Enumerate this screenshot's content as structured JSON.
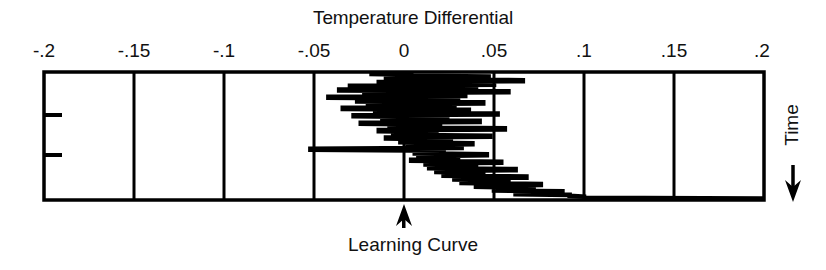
{
  "chart_data": {
    "type": "line",
    "title": "Temperature Differential",
    "xlabel": "Temperature Differential",
    "ylabel": "Time",
    "y_direction": "downward",
    "grid": true,
    "legend": null,
    "xlim": [
      -0.2,
      0.2
    ],
    "x_ticks": [
      -0.2,
      -0.15,
      -0.1,
      -0.05,
      0,
      0.05,
      0.1,
      0.15,
      0.2
    ],
    "x_tick_labels": [
      "-.2",
      "-.15",
      "-.1",
      "-.05",
      "0",
      ".05",
      ".1",
      ".15",
      ".2"
    ],
    "y_ticks": [
      0.32,
      0.65
    ],
    "y_tick_labels": [
      "",
      ""
    ],
    "annotations": [
      {
        "text": "Learning Curve",
        "x": 0,
        "position": "below-axis",
        "marker": "up-arrow"
      },
      {
        "text": "Time",
        "position": "right",
        "marker": "down-arrow",
        "orientation": "vertical"
      }
    ],
    "series": [
      {
        "name": "Temperature differential trace",
        "note": "Oscillating control trace; time runs from bottom (start) to top (end); amplitude narrows and mean drifts from 0 toward about 0.1",
        "points": [
          [
            0.0,
            1.0
          ],
          [
            -0.018,
            0.992
          ],
          [
            -0.018,
            0.984
          ],
          [
            0.004,
            0.978
          ],
          [
            0.004,
            0.97
          ],
          [
            0.047,
            0.964
          ],
          [
            0.047,
            0.956
          ],
          [
            -0.01,
            0.95
          ],
          [
            -0.01,
            0.942
          ],
          [
            0.066,
            0.936
          ],
          [
            0.066,
            0.928
          ],
          [
            -0.014,
            0.922
          ],
          [
            -0.014,
            0.914
          ],
          [
            0.05,
            0.908
          ],
          [
            0.05,
            0.9
          ],
          [
            -0.03,
            0.893
          ],
          [
            -0.03,
            0.885
          ],
          [
            0.04,
            0.879
          ],
          [
            0.04,
            0.871
          ],
          [
            -0.036,
            0.864
          ],
          [
            -0.036,
            0.856
          ],
          [
            0.058,
            0.85
          ],
          [
            0.058,
            0.842
          ],
          [
            -0.022,
            0.836
          ],
          [
            -0.022,
            0.828
          ],
          [
            0.034,
            0.821
          ],
          [
            0.034,
            0.813
          ],
          [
            -0.042,
            0.807
          ],
          [
            -0.042,
            0.799
          ],
          [
            0.03,
            0.792
          ],
          [
            0.03,
            0.784
          ],
          [
            -0.026,
            0.778
          ],
          [
            -0.026,
            0.77
          ],
          [
            0.044,
            0.763
          ],
          [
            0.044,
            0.755
          ],
          [
            -0.02,
            0.749
          ],
          [
            -0.02,
            0.741
          ],
          [
            0.028,
            0.734
          ],
          [
            0.028,
            0.726
          ],
          [
            -0.034,
            0.72
          ],
          [
            -0.034,
            0.712
          ],
          [
            0.036,
            0.705
          ],
          [
            0.036,
            0.697
          ],
          [
            -0.016,
            0.691
          ],
          [
            -0.016,
            0.683
          ],
          [
            0.052,
            0.676
          ],
          [
            0.052,
            0.668
          ],
          [
            -0.028,
            0.662
          ],
          [
            -0.028,
            0.654
          ],
          [
            0.024,
            0.647
          ],
          [
            0.024,
            0.639
          ],
          [
            -0.012,
            0.633
          ],
          [
            -0.012,
            0.625
          ],
          [
            0.042,
            0.618
          ],
          [
            0.042,
            0.61
          ],
          [
            -0.024,
            0.604
          ],
          [
            -0.024,
            0.596
          ],
          [
            0.02,
            0.589
          ],
          [
            0.02,
            0.581
          ],
          [
            -0.008,
            0.575
          ],
          [
            -0.008,
            0.567
          ],
          [
            0.056,
            0.56
          ],
          [
            0.056,
            0.552
          ],
          [
            -0.014,
            0.546
          ],
          [
            -0.014,
            0.538
          ],
          [
            0.018,
            0.531
          ],
          [
            0.018,
            0.523
          ],
          [
            -0.006,
            0.517
          ],
          [
            -0.006,
            0.509
          ],
          [
            0.048,
            0.502
          ],
          [
            0.048,
            0.494
          ],
          [
            -0.01,
            0.488
          ],
          [
            -0.01,
            0.48
          ],
          [
            0.026,
            0.473
          ],
          [
            0.026,
            0.465
          ],
          [
            -0.002,
            0.459
          ],
          [
            -0.002,
            0.451
          ],
          [
            0.038,
            0.444
          ],
          [
            0.038,
            0.436
          ],
          [
            0.002,
            0.43
          ],
          [
            0.002,
            0.422
          ],
          [
            0.032,
            0.415
          ],
          [
            0.032,
            0.407
          ],
          [
            -0.052,
            0.401
          ],
          [
            -0.052,
            0.393
          ],
          [
            0.022,
            0.386
          ],
          [
            0.022,
            0.378
          ],
          [
            0.006,
            0.372
          ],
          [
            0.006,
            0.364
          ],
          [
            0.046,
            0.357
          ],
          [
            0.046,
            0.349
          ],
          [
            0.008,
            0.343
          ],
          [
            0.008,
            0.335
          ],
          [
            0.03,
            0.328
          ],
          [
            0.03,
            0.32
          ],
          [
            0.004,
            0.314
          ],
          [
            0.004,
            0.306
          ],
          [
            0.054,
            0.299
          ],
          [
            0.054,
            0.291
          ],
          [
            0.012,
            0.285
          ],
          [
            0.012,
            0.277
          ],
          [
            0.04,
            0.27
          ],
          [
            0.04,
            0.262
          ],
          [
            0.014,
            0.256
          ],
          [
            0.014,
            0.248
          ],
          [
            0.062,
            0.241
          ],
          [
            0.062,
            0.233
          ],
          [
            0.018,
            0.227
          ],
          [
            0.018,
            0.219
          ],
          [
            0.044,
            0.212
          ],
          [
            0.044,
            0.204
          ],
          [
            0.022,
            0.198
          ],
          [
            0.022,
            0.19
          ],
          [
            0.068,
            0.183
          ],
          [
            0.068,
            0.175
          ],
          [
            0.028,
            0.169
          ],
          [
            0.028,
            0.161
          ],
          [
            0.058,
            0.154
          ],
          [
            0.058,
            0.146
          ],
          [
            0.032,
            0.14
          ],
          [
            0.032,
            0.132
          ],
          [
            0.076,
            0.125
          ],
          [
            0.076,
            0.117
          ],
          [
            0.04,
            0.111
          ],
          [
            0.04,
            0.103
          ],
          [
            0.072,
            0.096
          ],
          [
            0.072,
            0.088
          ],
          [
            0.05,
            0.082
          ],
          [
            0.05,
            0.074
          ],
          [
            0.088,
            0.068
          ],
          [
            0.088,
            0.06
          ],
          [
            0.062,
            0.054
          ],
          [
            0.062,
            0.046
          ],
          [
            0.092,
            0.04
          ],
          [
            0.092,
            0.032
          ],
          [
            0.1,
            0.026
          ],
          [
            0.1,
            0.018
          ],
          [
            0.2,
            0.012
          ],
          [
            0.2,
            0.006
          ]
        ]
      }
    ]
  },
  "figure": {
    "title": "Temperature Differential",
    "x_axis": {
      "tick_labels": [
        "-.2",
        "-.15",
        "-.1",
        "-.05",
        "0",
        ".05",
        ".1",
        ".15",
        ".2"
      ]
    },
    "y_axis": {
      "label": "Time",
      "direction_icon": "down-arrow-icon"
    },
    "bottom_annotation": {
      "label": "Learning Curve",
      "marker_icon": "up-arrow-icon"
    },
    "colors": {
      "ink": "#000000",
      "background": "#ffffff"
    }
  }
}
